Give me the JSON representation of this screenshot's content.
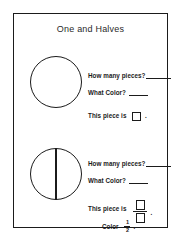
{
  "document": {
    "title": "One and Halves",
    "page_border_color": "#1b1b1b",
    "background_color": "#ffffff",
    "ink_color": "#1b1b1b"
  },
  "sections": [
    {
      "id": "one-whole",
      "figure": {
        "shape": "circle",
        "divided": false,
        "parts": 1,
        "divider_orientation": "none"
      },
      "prompts": {
        "how_many_pieces_label": "How many pieces?",
        "how_many_pieces_answer": "",
        "what_color_label": "What Color?",
        "what_color_answer": "",
        "this_piece_is_label": "This piece is",
        "this_piece_is_value": "",
        "period": "."
      }
    },
    {
      "id": "halves",
      "figure": {
        "shape": "circle",
        "divided": true,
        "parts": 2,
        "divider_orientation": "vertical"
      },
      "prompts": {
        "how_many_pieces_label": "How many pieces?",
        "how_many_pieces_answer": "",
        "what_color_label": "What Color?",
        "what_color_answer": "",
        "this_piece_is_label": "This piece is",
        "this_piece_is_numerator": "",
        "this_piece_is_denominator": "",
        "period": ".",
        "color_label": "Color",
        "color_fraction_numerator": "1",
        "color_fraction_denominator": "2",
        "color_period": "."
      }
    }
  ]
}
